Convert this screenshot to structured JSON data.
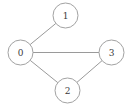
{
  "figure": {
    "kind": "undirected-graph-diagram",
    "width": 131,
    "height": 108,
    "background_color": "#ffffff",
    "node_stroke_color": "#a2a2a2",
    "node_fill_color": "#ffffff",
    "edge_color": "#9a9a9a",
    "label_color": "#3a3a3a",
    "node_radius": 12.5,
    "edge_width": 1
  },
  "graph_data": {
    "type": "graph",
    "directed": false,
    "node_count": 4,
    "edge_count": 4,
    "nodes": [
      {
        "id": "0",
        "label": "0",
        "x": 20.5,
        "y": 52.5,
        "degree": 3
      },
      {
        "id": "1",
        "label": "1",
        "x": 65.5,
        "y": 15.5,
        "degree": 1
      },
      {
        "id": "2",
        "label": "2",
        "x": 67.5,
        "y": 90.5,
        "degree": 2
      },
      {
        "id": "3",
        "label": "3",
        "x": 111.5,
        "y": 52.5,
        "degree": 2
      }
    ],
    "edges": [
      {
        "source": "0",
        "target": "1"
      },
      {
        "source": "0",
        "target": "3"
      },
      {
        "source": "0",
        "target": "2"
      },
      {
        "source": "2",
        "target": "3"
      }
    ],
    "adjacency": {
      "0": [
        "1",
        "2",
        "3"
      ],
      "1": [
        "0"
      ],
      "2": [
        "0",
        "3"
      ],
      "3": [
        "0",
        "2"
      ]
    }
  }
}
